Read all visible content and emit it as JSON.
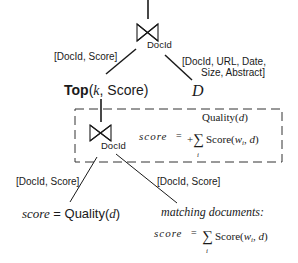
{
  "diagram": {
    "top_join": {
      "symbol": "join-bowtie",
      "label": "DocId"
    },
    "left_edge_label": "[DocId, Score]",
    "right_edge_label_line1": "[DocId, URL, Date,",
    "right_edge_label_line2": "Size, Abstract]",
    "top_op": {
      "name": "Top",
      "args_k": "k",
      "args_rest": ", Score)",
      "open": "("
    },
    "doc_table": "D",
    "inner_join": {
      "symbol": "join-bowtie",
      "label": "DocId"
    },
    "box_formula": {
      "lhs": "score",
      "eq": "=",
      "line1": "Quality(",
      "line1_var": "d",
      "line1_close": ")",
      "plus": "+",
      "sigma": "∑",
      "term": "Score(",
      "w": "w",
      "sub": "i",
      "rest": ", ",
      "d": "d",
      "close": ")",
      "index": "i"
    },
    "inner_left_edge_label": "[DocId, Score]",
    "inner_right_edge_label": "[DocId, Score]",
    "left_leaf": {
      "lhs": "score",
      "eq": " = ",
      "fn": "Quality(",
      "var": "d",
      "close": ")"
    },
    "right_leaf": {
      "title": "matching documents:",
      "lhs": "score",
      "eq": "=",
      "sigma": "∑",
      "term": "Score(",
      "w": "w",
      "sub": "i",
      "rest": ", ",
      "d": "d",
      "close": ")",
      "index": "i"
    }
  }
}
